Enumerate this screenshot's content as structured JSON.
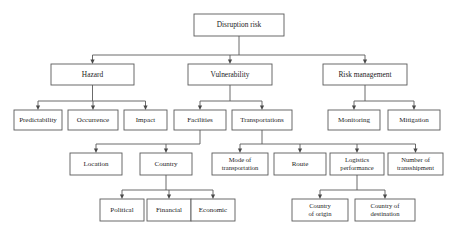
{
  "diagram": {
    "title": "Disruption risk",
    "type": "hierarchy-tree",
    "colors": {
      "box_border": "#5a5a5a",
      "box_fill": "#ffffff",
      "text": "#1c1c1c",
      "connector": "#5a5a5a",
      "background": "#ffffff"
    },
    "levels": [
      {
        "level": 1,
        "nodes": [
          {
            "id": "disruption-risk",
            "label": "Disruption risk",
            "lines": [
              "Disruption risk"
            ],
            "x": 194,
            "y": 14,
            "w": 90,
            "h": 22,
            "font": 7.4
          }
        ]
      },
      {
        "level": 2,
        "nodes": [
          {
            "id": "hazard",
            "label": "Hazard",
            "lines": [
              "Hazard"
            ],
            "x": 51,
            "y": 64,
            "w": 83,
            "h": 21,
            "font": 7.4
          },
          {
            "id": "vulnerability",
            "label": "Vulnerability",
            "lines": [
              "Vulnerability"
            ],
            "x": 188,
            "y": 64,
            "w": 84,
            "h": 21,
            "font": 7.4
          },
          {
            "id": "risk-management",
            "label": "Risk management",
            "lines": [
              "Risk management"
            ],
            "x": 323,
            "y": 64,
            "w": 84,
            "h": 21,
            "font": 7.4
          }
        ]
      },
      {
        "level": 3,
        "nodes": [
          {
            "id": "predictability",
            "label": "Predictability",
            "lines": [
              "Predictability"
            ],
            "x": 14,
            "y": 110,
            "w": 48,
            "h": 20,
            "font": 7.0
          },
          {
            "id": "occurrence",
            "label": "Occurrence",
            "lines": [
              "Occurrence"
            ],
            "x": 68,
            "y": 110,
            "w": 50,
            "h": 20,
            "font": 7.0
          },
          {
            "id": "impact",
            "label": "Impact",
            "lines": [
              "Impact"
            ],
            "x": 124,
            "y": 110,
            "w": 43,
            "h": 20,
            "font": 7.0
          },
          {
            "id": "facilities",
            "label": "Facilities",
            "lines": [
              "Facilities"
            ],
            "x": 174,
            "y": 110,
            "w": 52,
            "h": 20,
            "font": 7.0
          },
          {
            "id": "transportations",
            "label": "Transportations",
            "lines": [
              "Transportations"
            ],
            "x": 232,
            "y": 110,
            "w": 60,
            "h": 20,
            "font": 7.0
          },
          {
            "id": "monitoring",
            "label": "Monitoring",
            "lines": [
              "Monitoring"
            ],
            "x": 328,
            "y": 110,
            "w": 52,
            "h": 20,
            "font": 7.0
          },
          {
            "id": "mitigation",
            "label": "Mitigation",
            "lines": [
              "Mitigation"
            ],
            "x": 388,
            "y": 110,
            "w": 52,
            "h": 20,
            "font": 7.0
          }
        ]
      },
      {
        "level": 4,
        "nodes": [
          {
            "id": "location",
            "label": "Location",
            "lines": [
              "Location"
            ],
            "x": 70,
            "y": 153,
            "w": 52,
            "h": 22,
            "font": 7.0
          },
          {
            "id": "country",
            "label": "Country",
            "lines": [
              "Country"
            ],
            "x": 140,
            "y": 153,
            "w": 52,
            "h": 22,
            "font": 7.0
          },
          {
            "id": "mode-of-transportation",
            "label": "Mode of transportation",
            "lines": [
              "Mode of",
              "transportation"
            ],
            "x": 212,
            "y": 153,
            "w": 56,
            "h": 22,
            "font": 6.6
          },
          {
            "id": "route",
            "label": "Route",
            "lines": [
              "Route"
            ],
            "x": 274,
            "y": 153,
            "w": 52,
            "h": 22,
            "font": 7.0
          },
          {
            "id": "logistics-performance",
            "label": "Logistics performance",
            "lines": [
              "Logistics",
              "performance"
            ],
            "x": 330,
            "y": 153,
            "w": 54,
            "h": 22,
            "font": 6.6
          },
          {
            "id": "number-of-transshipment",
            "label": "Number of transshipment",
            "lines": [
              "Number of",
              "transshipment"
            ],
            "x": 388,
            "y": 153,
            "w": 55,
            "h": 22,
            "font": 6.6
          }
        ]
      },
      {
        "level": 5,
        "nodes": [
          {
            "id": "political",
            "label": "Political",
            "lines": [
              "Political"
            ],
            "x": 100,
            "y": 199,
            "w": 44,
            "h": 22,
            "font": 7.0
          },
          {
            "id": "financial",
            "label": "Financial",
            "lines": [
              "Financial"
            ],
            "x": 147,
            "y": 199,
            "w": 44,
            "h": 22,
            "font": 7.0
          },
          {
            "id": "economic",
            "label": "Economic",
            "lines": [
              "Economic"
            ],
            "x": 191,
            "y": 199,
            "w": 44,
            "h": 22,
            "font": 7.0
          },
          {
            "id": "country-of-origin",
            "label": "Country of origin",
            "lines": [
              "Country",
              "of origin"
            ],
            "x": 292,
            "y": 199,
            "w": 56,
            "h": 22,
            "font": 6.6
          },
          {
            "id": "country-of-destination",
            "label": "Country of destination",
            "lines": [
              "Country of",
              "destination"
            ],
            "x": 355,
            "y": 199,
            "w": 60,
            "h": 22,
            "font": 6.6
          }
        ]
      }
    ],
    "edges": [
      {
        "from": "disruption-risk",
        "to": [
          "hazard",
          "vulnerability",
          "risk-management"
        ]
      },
      {
        "from": "hazard",
        "to": [
          "predictability",
          "occurrence",
          "impact"
        ]
      },
      {
        "from": "vulnerability",
        "to": [
          "facilities",
          "transportations"
        ]
      },
      {
        "from": "risk-management",
        "to": [
          "monitoring",
          "mitigation"
        ]
      },
      {
        "from": "facilities",
        "to": [
          "location",
          "country"
        ]
      },
      {
        "from": "transportations",
        "to": [
          "mode-of-transportation",
          "route",
          "logistics-performance",
          "number-of-transshipment"
        ]
      },
      {
        "from": "country",
        "to": [
          "political",
          "financial",
          "economic"
        ]
      },
      {
        "from": "logistics-performance",
        "to": [
          "country-of-origin",
          "country-of-destination"
        ]
      }
    ]
  }
}
